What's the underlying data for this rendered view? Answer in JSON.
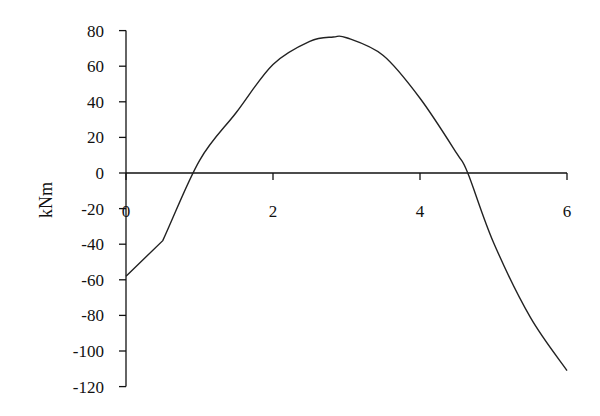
{
  "chart_data": {
    "type": "line",
    "title": "",
    "xlabel": "",
    "ylabel": "kNm",
    "xlim": [
      0,
      6
    ],
    "ylim": [
      -120,
      80
    ],
    "xticks": [
      0,
      2,
      4,
      6
    ],
    "xtick_labels": [
      "0",
      "2",
      "4",
      "6"
    ],
    "yticks": [
      80,
      60,
      40,
      20,
      0,
      -20,
      -40,
      -60,
      -80,
      -100,
      -120
    ],
    "ytick_labels": [
      "80",
      "60",
      "40",
      "20",
      "0",
      "-20",
      "-40",
      "-60",
      "-80",
      "-100",
      "-120"
    ],
    "grid": false,
    "legend": null,
    "series": [
      {
        "name": "Bending moment",
        "x": [
          0,
          0.5,
          1.0,
          1.5,
          2.0,
          2.5,
          2.82,
          3.0,
          3.5,
          4.0,
          4.5,
          4.65,
          5.0,
          5.5,
          6.0
        ],
        "values": [
          -58,
          -38,
          7,
          34,
          61,
          74,
          76.4,
          76,
          66,
          42,
          11,
          0,
          -39,
          -81,
          -111
        ]
      }
    ]
  },
  "colors": {
    "line": "#222222",
    "axis": "#111111",
    "background": "#ffffff"
  }
}
